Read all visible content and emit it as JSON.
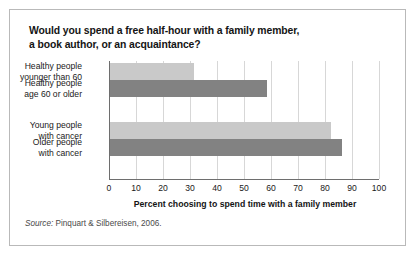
{
  "figure": {
    "title_line_1": "Would you spend a free half-hour with a family member,",
    "title_line_2": "a book author, or an acquaintance?",
    "source_word": "Source:",
    "source_text": "Pinquart & Silbereisen, 2006."
  },
  "chart_data": {
    "type": "bar",
    "orientation": "horizontal",
    "title": "Would you spend a free half-hour with a family member, a book author, or an acquaintance?",
    "xlabel": "Percent choosing to spend time with a family member",
    "ylabel": "",
    "xlim": [
      0,
      100
    ],
    "xticks": [
      0,
      10,
      20,
      30,
      40,
      50,
      60,
      70,
      80,
      90,
      100
    ],
    "xtick_labels": [
      "0",
      "10",
      "20",
      "30",
      "40",
      "50",
      "60",
      "70",
      "80",
      "90",
      "100"
    ],
    "grid": "vertical",
    "legend": "none",
    "categories": [
      "Healthy people younger than 60",
      "Healthy people age 60 or older",
      "Young people with cancer",
      "Older people with cancer"
    ],
    "category_label_lines": [
      [
        "Healthy people",
        "younger than 60"
      ],
      [
        "Healthy people",
        "age 60 or older"
      ],
      [
        "Young people",
        "with cancer"
      ],
      [
        "Older people",
        "with cancer"
      ]
    ],
    "values": [
      31,
      58,
      82,
      86
    ],
    "colors": [
      "#c9c9c9",
      "#828282",
      "#c9c9c9",
      "#828282"
    ],
    "color_light": "#c9c9c9",
    "color_dark": "#828282",
    "groups": [
      {
        "name": "Healthy people",
        "categories": [
          0,
          1
        ]
      },
      {
        "name": "People with cancer",
        "categories": [
          2,
          3
        ]
      }
    ]
  }
}
